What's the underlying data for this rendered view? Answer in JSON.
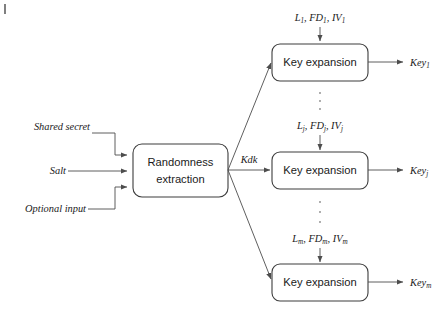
{
  "figure": {
    "type": "block-diagram",
    "corner_mark": "|"
  },
  "inputs": [
    {
      "label": "Shared secret"
    },
    {
      "label": "Salt"
    },
    {
      "label": "Optional input"
    }
  ],
  "extraction_block": {
    "line1": "Randomness",
    "line2": "extraction"
  },
  "intermediate": {
    "label": "Kdk"
  },
  "expansion_rows": [
    {
      "params_prefix": "L",
      "params_sub": "1",
      "params_text": "L₁, FD₁, IV₁",
      "param_parts": [
        {
          "base": "L",
          "sub": "1",
          "sep": ", "
        },
        {
          "base": "FD",
          "sub": "1",
          "sep": ", "
        },
        {
          "base": "IV",
          "sub": "1",
          "sep": ""
        }
      ],
      "box_label": "Key expansion",
      "output_base": "Key",
      "output_sub": "1",
      "output_text": "Key₁"
    },
    {
      "params_prefix": "L",
      "params_sub": "j",
      "params_text": "Lⱼ, FDⱼ, IVⱼ",
      "param_parts": [
        {
          "base": "L",
          "sub": "j",
          "sep": ", "
        },
        {
          "base": "FD",
          "sub": "j",
          "sep": ", "
        },
        {
          "base": "IV",
          "sub": "j",
          "sep": ""
        }
      ],
      "box_label": "Key expansion",
      "output_base": "Key",
      "output_sub": "j",
      "output_text": "Keyⱼ"
    },
    {
      "params_prefix": "L",
      "params_sub": "m",
      "params_text": "Lₘ, FDₘ, IVₘ",
      "param_parts": [
        {
          "base": "L",
          "sub": "m",
          "sep": ", "
        },
        {
          "base": "FD",
          "sub": "m",
          "sep": ", "
        },
        {
          "base": "IV",
          "sub": "m",
          "sep": ""
        }
      ],
      "box_label": "Key expansion",
      "output_base": "Key",
      "output_sub": "m",
      "output_text": "Keyₘ"
    }
  ],
  "ellipses": [
    {
      "name": "vertical-ellipsis-top",
      "dots": 3
    },
    {
      "name": "vertical-ellipsis-bottom",
      "dots": 3
    }
  ],
  "colors": {
    "line": "#4d4d4d",
    "box_stroke": "#3d3d3d",
    "text": "#1a1a1a",
    "dot": "#9a9a9a",
    "background": "#ffffff"
  }
}
